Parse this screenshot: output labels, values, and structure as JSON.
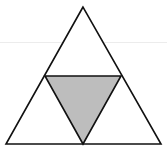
{
  "diagram": {
    "outer_triangle": {
      "points": [
        [
          83,
          7
        ],
        [
          6,
          144
        ],
        [
          161,
          144
        ]
      ],
      "fill": "#ffffff",
      "stroke": "#111111"
    },
    "inner_triangle": {
      "points": [
        [
          45,
          76
        ],
        [
          121,
          76
        ],
        [
          83,
          144
        ]
      ],
      "fill": "#bdbdbd",
      "stroke": "#111111"
    },
    "colors": {
      "stroke": "#111111",
      "shaded": "#bdbdbd",
      "background": "#ffffff",
      "faint_rule": "#ececec"
    }
  }
}
